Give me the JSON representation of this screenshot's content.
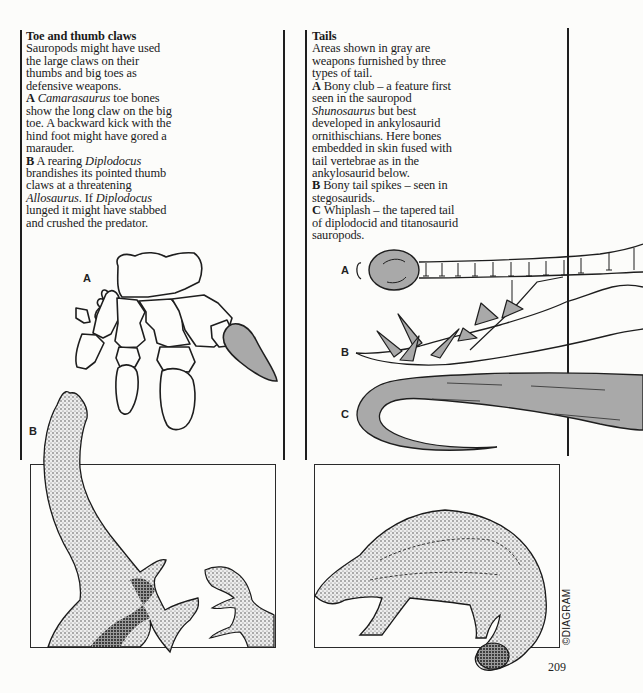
{
  "page": {
    "number": "209",
    "copyright": "©DIAGRAM"
  },
  "left_column": {
    "title": "Toe and thumb claws",
    "intro": "Sauropods might have used the large claws on their thumbs and big toes as defensive weapons.",
    "item_a": {
      "label": "A",
      "genus": "Camarasaurus",
      "text": " toe bones show the long claw on the big toe. A backward kick with the hind foot might have gored a marauder."
    },
    "item_b": {
      "label": "B",
      "text_1": " A rearing ",
      "genus_1": "Diplodocus",
      "text_2": " brandishes its pointed thumb claws at a threatening ",
      "genus_2": "Allosaurus",
      "text_3": ". If ",
      "genus_3": "Diplodocus",
      "text_4": " lunged it might have stabbed and crushed the predator."
    },
    "figure_labels": {
      "a": "A",
      "b": "B"
    }
  },
  "right_column": {
    "title": "Tails",
    "intro": "Areas shown in gray are weapons furnished by three types of tail.",
    "item_a": {
      "label": "A",
      "text_1": " Bony club – a feature first seen in the sauropod ",
      "genus": "Shunosaurus",
      "text_2": " but best developed in ankylosaurid ornithischians. Here bones embedded in skin fused with tail vertebrae as in the ankylosaurid below."
    },
    "item_b": {
      "label": "B",
      "text": " Bony tail spikes – seen in stegosaurids."
    },
    "item_c": {
      "label": "C",
      "text": " Whiplash – the tapered tail of diplodocid and titanosaurid sauropods."
    },
    "figure_labels": {
      "a": "A",
      "b": "B",
      "c": "C"
    }
  },
  "colors": {
    "weapon_gray": "#a9a9a9",
    "ink": "#1e1e1e",
    "paper": "#fcfcfa"
  }
}
